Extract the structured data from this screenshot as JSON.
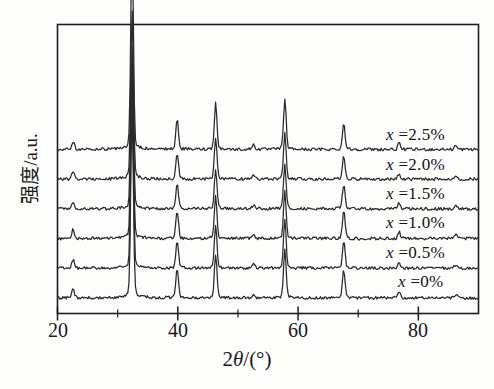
{
  "chart_data": {
    "type": "line",
    "title": "",
    "xlabel": "2θ/(°)",
    "ylabel": "强度/a.u.",
    "xlim": [
      20,
      90
    ],
    "ylim": [
      0,
      1
    ],
    "grid": false,
    "legend_position": "inside-right",
    "x_ticks_major": [
      20,
      40,
      60,
      80
    ],
    "x_tick_labels": [
      "20",
      "40",
      "60",
      "80"
    ],
    "x_ticks_minor": [
      30,
      50,
      70
    ],
    "y_ticks": [],
    "y_tick_labels": [],
    "peak_positions_deg": [
      22.6,
      32.4,
      39.9,
      46.3,
      52.6,
      57.8,
      67.6,
      76.8,
      86.2
    ],
    "series": [
      {
        "name": "x =2.5%",
        "label": "x =2.5%",
        "baseline_offset": 5,
        "color": "#2a2a2a",
        "peaks": [
          {
            "x": 22.6,
            "h": 0.03
          },
          {
            "x": 32.4,
            "h": 0.76
          },
          {
            "x": 39.9,
            "h": 0.11
          },
          {
            "x": 46.3,
            "h": 0.17
          },
          {
            "x": 52.6,
            "h": 0.018
          },
          {
            "x": 57.8,
            "h": 0.185
          },
          {
            "x": 67.6,
            "h": 0.095
          },
          {
            "x": 76.8,
            "h": 0.022
          },
          {
            "x": 86.2,
            "h": 0.014
          }
        ]
      },
      {
        "name": "x =2.0%",
        "label": "x =2.0%",
        "baseline_offset": 4,
        "color": "#2a2a2a",
        "peaks": [
          {
            "x": 22.6,
            "h": 0.028
          },
          {
            "x": 32.4,
            "h": 0.62
          },
          {
            "x": 39.9,
            "h": 0.095
          },
          {
            "x": 46.3,
            "h": 0.15
          },
          {
            "x": 52.6,
            "h": 0.015
          },
          {
            "x": 57.8,
            "h": 0.165
          },
          {
            "x": 67.6,
            "h": 0.085
          },
          {
            "x": 76.8,
            "h": 0.02
          },
          {
            "x": 86.2,
            "h": 0.012
          }
        ]
      },
      {
        "name": "x =1.5%",
        "label": "x =1.5%",
        "baseline_offset": 3,
        "color": "#2a2a2a",
        "peaks": [
          {
            "x": 22.6,
            "h": 0.026
          },
          {
            "x": 32.4,
            "h": 0.6
          },
          {
            "x": 39.9,
            "h": 0.09
          },
          {
            "x": 46.3,
            "h": 0.145
          },
          {
            "x": 52.6,
            "h": 0.014
          },
          {
            "x": 57.8,
            "h": 0.16
          },
          {
            "x": 67.6,
            "h": 0.09
          },
          {
            "x": 76.8,
            "h": 0.02
          },
          {
            "x": 86.2,
            "h": 0.012
          }
        ]
      },
      {
        "name": "x =1.0%",
        "label": "x =1.0%",
        "baseline_offset": 2,
        "color": "#2a2a2a",
        "peaks": [
          {
            "x": 22.6,
            "h": 0.034
          },
          {
            "x": 32.4,
            "h": 0.64
          },
          {
            "x": 39.9,
            "h": 0.1
          },
          {
            "x": 46.3,
            "h": 0.155
          },
          {
            "x": 52.6,
            "h": 0.016
          },
          {
            "x": 57.8,
            "h": 0.17
          },
          {
            "x": 67.6,
            "h": 0.105
          },
          {
            "x": 76.8,
            "h": 0.024
          },
          {
            "x": 86.2,
            "h": 0.014
          }
        ]
      },
      {
        "name": "x =0.5%",
        "label": "x =0.5%",
        "baseline_offset": 1,
        "color": "#2a2a2a",
        "peaks": [
          {
            "x": 22.6,
            "h": 0.03
          },
          {
            "x": 32.4,
            "h": 0.66
          },
          {
            "x": 39.9,
            "h": 0.1
          },
          {
            "x": 46.3,
            "h": 0.16
          },
          {
            "x": 52.6,
            "h": 0.016
          },
          {
            "x": 57.8,
            "h": 0.175
          },
          {
            "x": 67.6,
            "h": 0.1
          },
          {
            "x": 76.8,
            "h": 0.022
          },
          {
            "x": 86.2,
            "h": 0.013
          }
        ]
      },
      {
        "name": "x =0%",
        "label": "x =0%",
        "baseline_offset": 0,
        "color": "#2a2a2a",
        "peaks": [
          {
            "x": 22.6,
            "h": 0.032
          },
          {
            "x": 32.4,
            "h": 0.68
          },
          {
            "x": 39.9,
            "h": 0.105
          },
          {
            "x": 46.3,
            "h": 0.16
          },
          {
            "x": 52.6,
            "h": 0.015
          },
          {
            "x": 57.8,
            "h": 0.18
          },
          {
            "x": 67.6,
            "h": 0.1
          },
          {
            "x": 76.8,
            "h": 0.022
          },
          {
            "x": 86.2,
            "h": 0.012
          }
        ]
      }
    ]
  },
  "axes": {
    "x_title_prefix": "2",
    "x_title_theta": "θ",
    "x_title_suffix": "/(°)",
    "y_title": "强度/a.u."
  },
  "ticks": {
    "x": [
      {
        "value": 20,
        "label": "20"
      },
      {
        "value": 40,
        "label": "40"
      },
      {
        "value": 60,
        "label": "60"
      },
      {
        "value": 80,
        "label": "80"
      }
    ]
  },
  "series_labels": [
    {
      "var": "x",
      "eq": " =2.5%"
    },
    {
      "var": "x",
      "eq": " =2.0%"
    },
    {
      "var": "x",
      "eq": " =1.5%"
    },
    {
      "var": "x",
      "eq": " =1.0%"
    },
    {
      "var": "x",
      "eq": " =0.5%"
    },
    {
      "var": "x",
      "eq": " =0%"
    }
  ],
  "style": {
    "frame_color": "#1c1c1c",
    "trace_color": "#2a2a2a",
    "background": "#fdfdfc"
  }
}
